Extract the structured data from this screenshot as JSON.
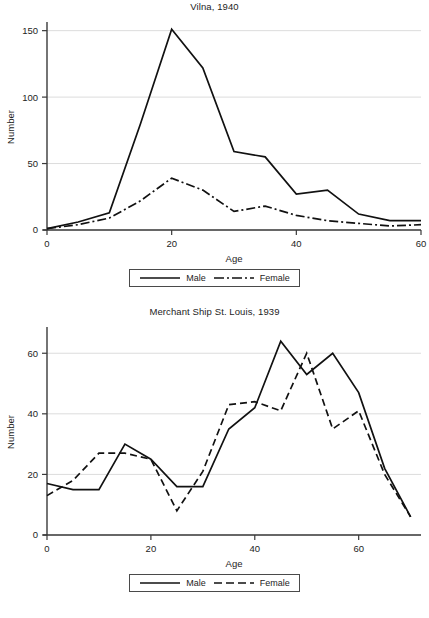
{
  "figures": [
    {
      "id": "vilna",
      "title": "Vilna, 1940",
      "xlabel": "Age",
      "ylabel": "Number",
      "legend": [
        {
          "label": "Male",
          "style": "solid"
        },
        {
          "label": "Female",
          "style": "dashdot"
        }
      ],
      "chart_data": {
        "type": "line",
        "title": "Vilna, 1940",
        "xlabel": "Age",
        "ylabel": "Number",
        "xlim": [
          0,
          60
        ],
        "ylim": [
          0,
          155
        ],
        "xticks": [
          0,
          20,
          40,
          60
        ],
        "yticks": [
          0,
          50,
          100,
          150
        ],
        "grid": "horizontal",
        "legend_position": "below",
        "x": [
          0,
          5,
          10,
          15,
          20,
          25,
          30,
          35,
          40,
          45,
          50,
          55,
          60
        ],
        "series": [
          {
            "name": "Male",
            "style": "solid",
            "values": [
              1,
              6,
              13,
              80,
              151,
              122,
              59,
              55,
              27,
              30,
              12,
              7,
              7
            ]
          },
          {
            "name": "Female",
            "style": "dashdot",
            "values": [
              1,
              4,
              9,
              22,
              39,
              30,
              14,
              18,
              11,
              7,
              5,
              3,
              4
            ]
          }
        ]
      }
    },
    {
      "id": "stlouis",
      "title": "Merchant Ship St. Louis, 1939",
      "xlabel": "Age",
      "ylabel": "Number",
      "legend": [
        {
          "label": "Male",
          "style": "solid"
        },
        {
          "label": "Female",
          "style": "dashed"
        }
      ],
      "chart_data": {
        "type": "line",
        "title": "Merchant Ship St. Louis, 1939",
        "xlabel": "Age",
        "ylabel": "Number",
        "xlim": [
          0,
          72
        ],
        "ylim": [
          0,
          68
        ],
        "xticks": [
          0,
          20,
          40,
          60
        ],
        "yticks": [
          0,
          20,
          40,
          60
        ],
        "grid": "horizontal",
        "legend_position": "below",
        "x": [
          0,
          5,
          10,
          15,
          20,
          25,
          30,
          35,
          40,
          45,
          50,
          55,
          60,
          65,
          70
        ],
        "series": [
          {
            "name": "Male",
            "style": "solid",
            "values": [
              17,
              15,
              15,
              30,
              25,
              16,
              16,
              35,
              42,
              64,
              53,
              60,
              47,
              22,
              6
            ]
          },
          {
            "name": "Female",
            "style": "dashed",
            "values": [
              13,
              18,
              27,
              27,
              25,
              8,
              21,
              43,
              44,
              41,
              60,
              35,
              41,
              20,
              6
            ]
          }
        ]
      }
    }
  ]
}
